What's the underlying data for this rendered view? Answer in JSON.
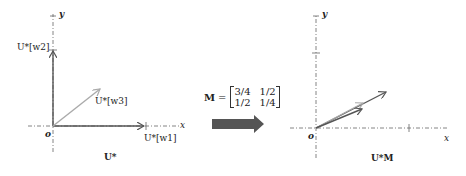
{
  "left_plot": {
    "y_axis_label": "y",
    "x_axis_label": "x",
    "origin_label": "o",
    "vectors": [
      {
        "name": "w1",
        "label": "U*[w1]",
        "color": "#555555"
      },
      {
        "name": "w2",
        "label": "U*[w2]",
        "color": "#555555"
      },
      {
        "name": "w3",
        "label": "U*[w3]",
        "color": "#aaaaaa"
      }
    ],
    "caption": "U*"
  },
  "transform": {
    "matrix_name": "M",
    "equals": "=",
    "matrix": [
      [
        "3/4",
        "1/2"
      ],
      [
        "1/2",
        "1/4"
      ]
    ],
    "arrow_color": "#555555"
  },
  "right_plot": {
    "y_axis_label": "y",
    "x_axis_label": "x",
    "origin_label": "o",
    "caption": "U*M"
  }
}
